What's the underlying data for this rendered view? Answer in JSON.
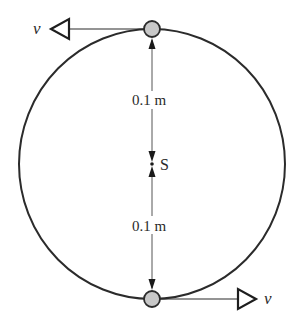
{
  "figure": {
    "orbit": {
      "cx": 152,
      "cy": 164,
      "rx": 133,
      "ry": 135,
      "stroke": "#2b2b2b"
    },
    "center_label": "S",
    "stars": [
      {
        "name": "top",
        "cx": 152,
        "cy": 29,
        "r": 8,
        "fill": "#c8c8c8"
      },
      {
        "name": "bottom",
        "cx": 152,
        "cy": 299,
        "r": 8,
        "fill": "#c8c8c8"
      }
    ],
    "velocity_labels": {
      "top": "v",
      "bottom": "v"
    },
    "distance_labels": {
      "top": "0.1 m",
      "bottom": "0.1 m"
    }
  }
}
